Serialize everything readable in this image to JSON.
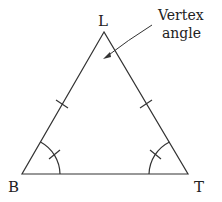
{
  "diagram": {
    "type": "isosceles-triangle",
    "vertices": {
      "apex": {
        "label": "L"
      },
      "base_left": {
        "label": "B"
      },
      "base_right": {
        "label": "T"
      }
    },
    "annotation": {
      "line1": "Vertex",
      "line2": "angle"
    },
    "congruent_side_marks": 2,
    "congruent_angle_marks": 2
  }
}
